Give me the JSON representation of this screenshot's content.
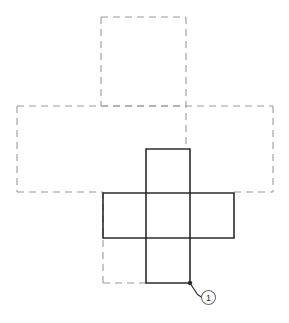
{
  "figure": {
    "type": "technical-line-drawing",
    "background_color": "#ffffff",
    "solid_line_color": "#2b2b2b",
    "dashed_line_color": "#9a9a9a",
    "solid_line_width": 1.6,
    "dashed_line_width": 1.1,
    "dash_pattern": "7,5",
    "canvas": {
      "width": 289,
      "height": 323
    }
  },
  "geometry": {
    "top_dashed_panel": {
      "x": 101,
      "y": 17,
      "width": 85,
      "height": 89
    },
    "wide_dashed_panel": {
      "x": 17,
      "y": 106,
      "width": 256,
      "height": 86
    },
    "bottom_left_dashed_panel": {
      "x": 103,
      "y": 238,
      "width": 43,
      "height": 45
    },
    "cross_vertical_arm": {
      "x": 146,
      "y": 149,
      "width": 44,
      "height": 134
    },
    "cross_horizontal_arm": {
      "x": 103,
      "y": 193,
      "width": 131,
      "height": 45
    },
    "cross_inner_divider_left_x": 146,
    "cross_inner_divider_right_x": 190,
    "cross_inner_divider_top_y": 193,
    "cross_inner_divider_bottom_y": 238
  },
  "callout": {
    "number": "1",
    "anchor_point": {
      "x": 190,
      "y": 283
    },
    "elbow_point": {
      "x": 197,
      "y": 294
    },
    "balloon_center": {
      "x": 208,
      "y": 298
    },
    "balloon_radius": 7,
    "dot_radius": 2.2
  }
}
